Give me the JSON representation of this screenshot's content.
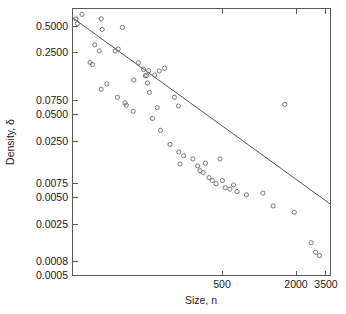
{
  "chart_data": {
    "type": "scatter",
    "title": "",
    "subtitle": "",
    "xlabel": "Size, n",
    "ylabel": "Density, δ",
    "xscale": "log",
    "yscale": "log",
    "grid": false,
    "legend": "none",
    "xlim": [
      30,
      4200
    ],
    "ylim": [
      0.0005,
      0.62
    ],
    "xticks": [
      500,
      2000,
      3500
    ],
    "xticklabels": [
      "500",
      "2000",
      "3500"
    ],
    "yticks": [
      0.5,
      0.25,
      0.075,
      0.05,
      0.025,
      0.0075,
      0.005,
      0.0025,
      0.0008,
      0.0005
    ],
    "yticklabels": [
      "0.5000",
      "0.2500",
      "0.0750",
      "0.0500",
      "0.0250",
      "0.0075",
      "0.0050",
      "0.0025",
      "0.0008",
      "0.0005"
    ],
    "marker_style": "open-circle",
    "marker_color": "#6b6b6b",
    "line_color": "#555555",
    "points": [
      {
        "x": 32,
        "y": 0.47
      },
      {
        "x": 36,
        "y": 0.53
      },
      {
        "x": 33,
        "y": 0.415
      },
      {
        "x": 52,
        "y": 0.47
      },
      {
        "x": 53,
        "y": 0.355
      },
      {
        "x": 78,
        "y": 0.375
      },
      {
        "x": 46,
        "y": 0.235
      },
      {
        "x": 50,
        "y": 0.2
      },
      {
        "x": 72,
        "y": 0.21
      },
      {
        "x": 42,
        "y": 0.147
      },
      {
        "x": 44,
        "y": 0.139
      },
      {
        "x": 68,
        "y": 0.2
      },
      {
        "x": 106,
        "y": 0.146
      },
      {
        "x": 117,
        "y": 0.122
      },
      {
        "x": 129,
        "y": 0.118
      },
      {
        "x": 121,
        "y": 0.103
      },
      {
        "x": 97,
        "y": 0.092
      },
      {
        "x": 58,
        "y": 0.083
      },
      {
        "x": 52,
        "y": 0.072
      },
      {
        "x": 124,
        "y": 0.104
      },
      {
        "x": 126,
        "y": 0.085
      },
      {
        "x": 158,
        "y": 0.117
      },
      {
        "x": 145,
        "y": 0.105
      },
      {
        "x": 175,
        "y": 0.126
      },
      {
        "x": 71,
        "y": 0.058
      },
      {
        "x": 82,
        "y": 0.05
      },
      {
        "x": 84,
        "y": 0.047
      },
      {
        "x": 131,
        "y": 0.066
      },
      {
        "x": 96,
        "y": 0.04
      },
      {
        "x": 152,
        "y": 0.044
      },
      {
        "x": 211,
        "y": 0.058
      },
      {
        "x": 139,
        "y": 0.033
      },
      {
        "x": 228,
        "y": 0.046
      },
      {
        "x": 162,
        "y": 0.024
      },
      {
        "x": 194,
        "y": 0.0165
      },
      {
        "x": 230,
        "y": 0.0135
      },
      {
        "x": 252,
        "y": 0.0122
      },
      {
        "x": 235,
        "y": 0.0098
      },
      {
        "x": 301,
        "y": 0.0112
      },
      {
        "x": 330,
        "y": 0.0093
      },
      {
        "x": 345,
        "y": 0.0082
      },
      {
        "x": 366,
        "y": 0.0078
      },
      {
        "x": 383,
        "y": 0.01
      },
      {
        "x": 410,
        "y": 0.0068
      },
      {
        "x": 437,
        "y": 0.0063
      },
      {
        "x": 470,
        "y": 0.0058
      },
      {
        "x": 505,
        "y": 0.0112
      },
      {
        "x": 530,
        "y": 0.0063
      },
      {
        "x": 560,
        "y": 0.0052
      },
      {
        "x": 612,
        "y": 0.005
      },
      {
        "x": 655,
        "y": 0.0056
      },
      {
        "x": 700,
        "y": 0.0047
      },
      {
        "x": 840,
        "y": 0.0043
      },
      {
        "x": 1150,
        "y": 0.0045
      },
      {
        "x": 1400,
        "y": 0.0032
      },
      {
        "x": 2100,
        "y": 0.0027
      },
      {
        "x": 2900,
        "y": 0.0012
      },
      {
        "x": 3150,
        "y": 0.00093
      },
      {
        "x": 3400,
        "y": 0.00085
      },
      {
        "x": 1750,
        "y": 0.048
      }
    ],
    "fit_line": {
      "type": "linear-in-log-log",
      "endpoints": [
        {
          "x": 30,
          "y": 0.484
        },
        {
          "x": 4200,
          "y": 0.00335
        }
      ]
    },
    "n_points": 60
  }
}
